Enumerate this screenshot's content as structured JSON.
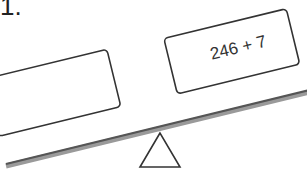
{
  "question": {
    "number_label": "1."
  },
  "balance": {
    "left_pan": {
      "text": ""
    },
    "right_pan": {
      "text": "246 + 7"
    },
    "tilt": "down-left"
  },
  "colors": {
    "stroke": "#333333",
    "beam": "#6e6e6e",
    "box_fill": "#ffffff"
  }
}
